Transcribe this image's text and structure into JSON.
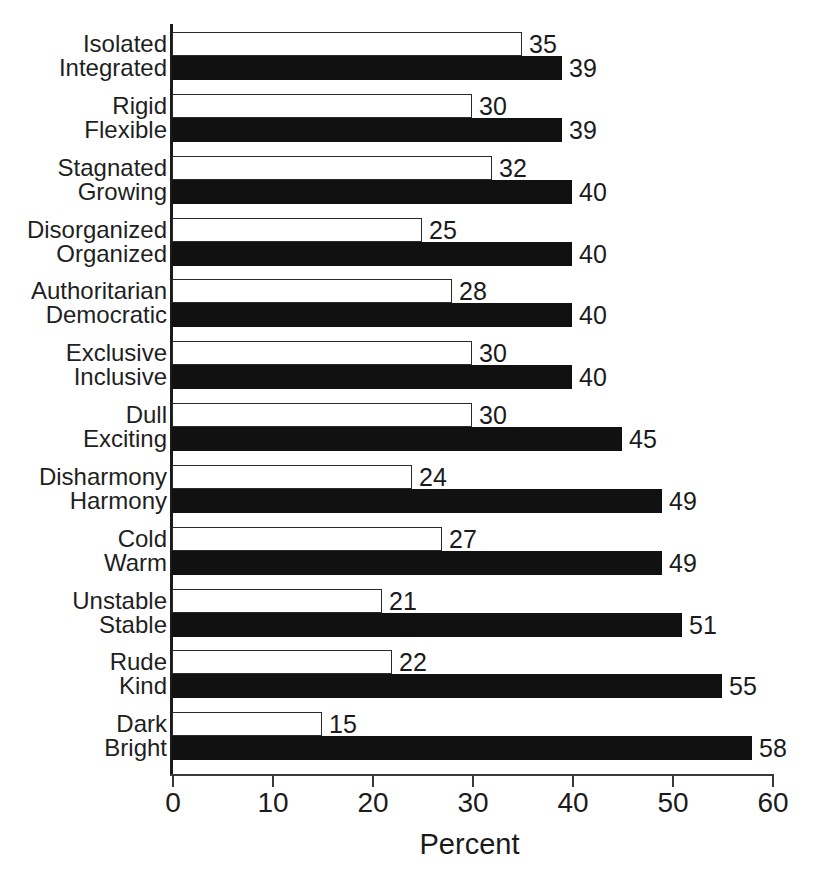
{
  "chart_data": {
    "type": "bar",
    "orientation": "horizontal",
    "title": "",
    "xlabel": "Percent",
    "ylabel": "",
    "xlim": [
      0,
      60
    ],
    "xticks": [
      0,
      10,
      20,
      30,
      40,
      50,
      60
    ],
    "xtick_labels": [
      "0",
      "10",
      "20",
      "30",
      "40",
      "50",
      "60"
    ],
    "grid": false,
    "legend": null,
    "value_labels": true,
    "series": [
      {
        "name": "negative-pole",
        "style": "hollow",
        "fill": "#ffffff",
        "edge": "#2a2a2a"
      },
      {
        "name": "positive-pole",
        "style": "solid",
        "fill": "#111111",
        "edge": "#111111"
      }
    ],
    "groups": [
      {
        "negative": {
          "label": "Isolated",
          "value": 35
        },
        "positive": {
          "label": "Integrated",
          "value": 39
        }
      },
      {
        "negative": {
          "label": "Rigid",
          "value": 30
        },
        "positive": {
          "label": "Flexible",
          "value": 39
        }
      },
      {
        "negative": {
          "label": "Stagnated",
          "value": 32
        },
        "positive": {
          "label": "Growing",
          "value": 40
        }
      },
      {
        "negative": {
          "label": "Disorganized",
          "value": 25
        },
        "positive": {
          "label": "Organized",
          "value": 40
        }
      },
      {
        "negative": {
          "label": "Authoritarian",
          "value": 28
        },
        "positive": {
          "label": "Democratic",
          "value": 40
        }
      },
      {
        "negative": {
          "label": "Exclusive",
          "value": 30
        },
        "positive": {
          "label": "Inclusive",
          "value": 40
        }
      },
      {
        "negative": {
          "label": "Dull",
          "value": 30
        },
        "positive": {
          "label": "Exciting",
          "value": 45
        }
      },
      {
        "negative": {
          "label": "Disharmony",
          "value": 24
        },
        "positive": {
          "label": "Harmony",
          "value": 49
        }
      },
      {
        "negative": {
          "label": "Cold",
          "value": 27
        },
        "positive": {
          "label": "Warm",
          "value": 49
        }
      },
      {
        "negative": {
          "label": "Unstable",
          "value": 21
        },
        "positive": {
          "label": "Stable",
          "value": 51
        }
      },
      {
        "negative": {
          "label": "Rude",
          "value": 22
        },
        "positive": {
          "label": "Kind",
          "value": 55
        }
      },
      {
        "negative": {
          "label": "Dark",
          "value": 15
        },
        "positive": {
          "label": "Bright",
          "value": 58
        }
      }
    ]
  }
}
